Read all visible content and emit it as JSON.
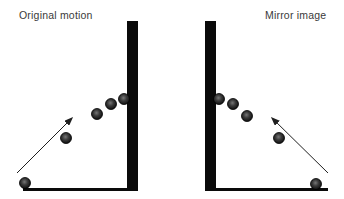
{
  "figure": {
    "colors": {
      "background": "#ffffff",
      "wall": "#0a0a0a",
      "floor": "#0a0a0a",
      "arrow": "#1f1f1f",
      "ball_edge": "#000000",
      "ball_core": "#767676",
      "ball_mid": "#3a3a3a",
      "ball_rim": "#0d0d0d",
      "label_text": "#3a3a3a"
    },
    "ball_radius": 5.5,
    "panels": [
      {
        "name": "original-motion",
        "label": "Original motion",
        "label_pos": {
          "x": 19,
          "y": 9
        },
        "wall": {
          "x": 127,
          "y": 21,
          "width": 11,
          "height": 170
        },
        "floor": {
          "x": 23,
          "y": 188,
          "width": 115,
          "height": 3
        },
        "balls": [
          {
            "x": 25,
            "y": 183
          },
          {
            "x": 66,
            "y": 138
          },
          {
            "x": 97,
            "y": 114
          },
          {
            "x": 111,
            "y": 104
          },
          {
            "x": 124,
            "y": 99
          }
        ],
        "arrow": {
          "from": {
            "x": 17,
            "y": 173
          },
          "to": {
            "x": 72,
            "y": 118
          }
        }
      },
      {
        "name": "mirror-image",
        "label": "Mirror image",
        "label_pos": {
          "x": 265,
          "y": 9
        },
        "wall": {
          "x": 205,
          "y": 21,
          "width": 11,
          "height": 170
        },
        "floor": {
          "x": 206,
          "y": 188,
          "width": 122,
          "height": 3
        },
        "balls": [
          {
            "x": 219,
            "y": 99
          },
          {
            "x": 233,
            "y": 104
          },
          {
            "x": 247,
            "y": 116
          },
          {
            "x": 279,
            "y": 138
          },
          {
            "x": 316,
            "y": 184
          }
        ],
        "arrow": {
          "from": {
            "x": 328,
            "y": 173
          },
          "to": {
            "x": 272,
            "y": 118
          }
        }
      }
    ]
  }
}
